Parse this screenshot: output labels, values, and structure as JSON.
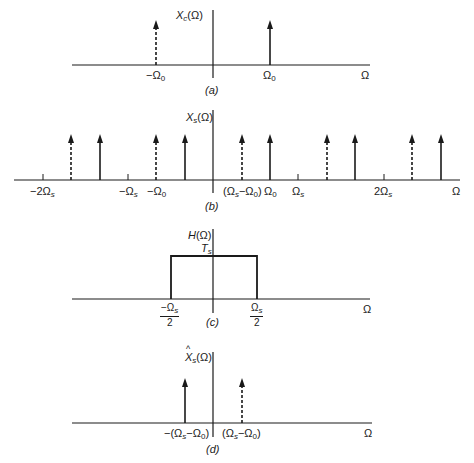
{
  "figure": {
    "panels": [
      {
        "id": "a",
        "caption": "(a)",
        "ylabel": {
          "main": "X",
          "sub": "c",
          "arg": "(Ω)"
        },
        "xaxis_label": "Ω",
        "ticks": [
          {
            "label_main": "−Ω",
            "label_sub": "0"
          },
          {
            "label_main": "Ω",
            "label_sub": "0"
          }
        ],
        "impulses": [
          {
            "position": "-Ω0",
            "style": "dashed"
          },
          {
            "position": "Ω0",
            "style": "solid"
          }
        ]
      },
      {
        "id": "b",
        "caption": "(b)",
        "ylabel": {
          "main": "X",
          "sub": "s",
          "arg": "(Ω)"
        },
        "xaxis_label": "Ω",
        "ticks": [
          {
            "label": "−2Ω",
            "sub": "s"
          },
          {
            "label": "−Ω",
            "sub": "s"
          },
          {
            "label": "−Ω",
            "sub0": "0"
          },
          {
            "label": "(Ω",
            "sub": "s",
            "rest": "−Ω",
            "sub0": "0",
            "close": ")"
          },
          {
            "label": "Ω",
            "sub0": "0"
          },
          {
            "label": "Ω",
            "sub": "s"
          },
          {
            "label": "2Ω",
            "sub": "s"
          }
        ],
        "impulses": [
          {
            "position": "-2Ωs+(Ωs-Ω0)",
            "style": "dashed"
          },
          {
            "position": "-2Ωs+Ω0",
            "style": "solid"
          },
          {
            "position": "-Ω0",
            "style": "dashed"
          },
          {
            "position": "-Ωs+Ω0",
            "style": "solid"
          },
          {
            "position": "Ωs-Ω0",
            "style": "dashed"
          },
          {
            "position": "Ω0",
            "style": "solid"
          },
          {
            "position": "2Ωs-Ω0",
            "style": "dashed"
          },
          {
            "position": "Ωs+Ω0",
            "style": "solid"
          },
          {
            "position": "3Ωs-Ω0",
            "style": "dashed"
          },
          {
            "position": "2Ωs+Ω0",
            "style": "solid"
          }
        ]
      },
      {
        "id": "c",
        "caption": "(c)",
        "ylabel": {
          "main": "H",
          "arg": "(Ω)"
        },
        "level_label": {
          "main": "T",
          "sub": "s"
        },
        "xaxis_label": "Ω",
        "edges": [
          {
            "numerator": "−Ω",
            "sub": "s",
            "denominator": "2"
          },
          {
            "numerator": "Ω",
            "sub": "s",
            "denominator": "2"
          }
        ]
      },
      {
        "id": "d",
        "caption": "(d)",
        "ylabel": {
          "hat": "^",
          "main": "X",
          "sub": "s",
          "arg": "(Ω)"
        },
        "xaxis_label": "Ω",
        "ticks": [
          {
            "pre": "−(Ω",
            "sub": "s",
            "mid": "−Ω",
            "sub0": "0",
            "close": ")"
          },
          {
            "pre": "(Ω",
            "sub": "s",
            "mid": "−Ω",
            "sub0": "0",
            "close": ")"
          }
        ],
        "impulses": [
          {
            "position": "-(Ωs-Ω0)",
            "style": "solid"
          },
          {
            "position": "(Ωs-Ω0)",
            "style": "dashed"
          }
        ]
      }
    ]
  }
}
